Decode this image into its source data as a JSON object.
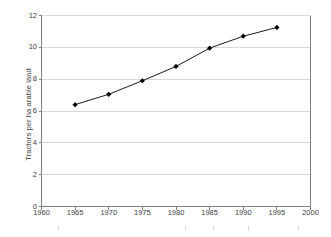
{
  "chart_data": {
    "type": "line",
    "title": "",
    "subtitle": "",
    "xlabel": "",
    "ylabel": "Tractors per ha arable land",
    "x": [
      1965,
      1970,
      1975,
      1980,
      1985,
      1990,
      1995
    ],
    "values": [
      6.4,
      7.05,
      7.9,
      8.8,
      9.95,
      10.7,
      11.25
    ],
    "series": [
      {
        "name": "Tractors per ha arable land",
        "x": [
          1965,
          1970,
          1975,
          1980,
          1985,
          1990,
          1995
        ],
        "values": [
          6.4,
          7.05,
          7.9,
          8.8,
          9.95,
          10.7,
          11.25
        ]
      }
    ],
    "xlim": [
      1960,
      2000
    ],
    "ylim": [
      0,
      12
    ],
    "xticks": [
      1960,
      1965,
      1970,
      1975,
      1980,
      1985,
      1990,
      1995,
      2000
    ],
    "yticks": [
      0,
      2,
      4,
      6,
      8,
      10,
      12
    ],
    "xtick_labels": [
      "1960",
      "1965",
      "1970",
      "1975",
      "1980",
      "1985",
      "1990",
      "1995",
      "2000"
    ],
    "ytick_labels": [
      "0",
      "2",
      "4",
      "6",
      "8",
      "10",
      "12"
    ],
    "grid": {
      "horizontal": true,
      "vertical": false
    },
    "legend": {
      "visible": false,
      "position": "none",
      "entries": []
    },
    "annotations": [],
    "marker": "diamond",
    "colors": {
      "line": "#1a1a1a",
      "marker": "#000000",
      "gridline": "#d9d9d9",
      "axis": "#808080",
      "text": "#3d3d3d",
      "background": "#ffffff"
    }
  }
}
